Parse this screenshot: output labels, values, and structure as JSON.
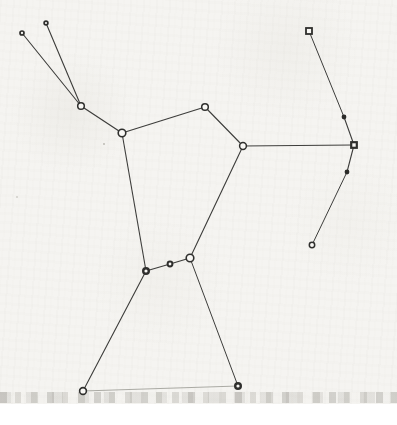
{
  "page": {
    "kind": "scanned constellation line figure",
    "paper_color": "#f5f4f1",
    "page_white": "#ffffff",
    "paper_height_px": 404
  },
  "diagram": {
    "type": "node-link-constellation",
    "colors": {
      "line": "#3d3d3b",
      "faint_line": "#a2a29b",
      "star_stroke": "#2f2f2d",
      "star_open_fill": "#f9f8f5",
      "star_dark_fill": "#2b2b29"
    },
    "stars": [
      {
        "id": "club-tip-left",
        "x": 22,
        "y": 33,
        "shape": "circle",
        "r": 2.0,
        "sw": 1.7,
        "fill": "open"
      },
      {
        "id": "club-tip-right",
        "x": 46,
        "y": 23,
        "shape": "circle",
        "r": 1.9,
        "sw": 1.7,
        "fill": "open"
      },
      {
        "id": "club-elbow",
        "x": 81,
        "y": 106,
        "shape": "circle",
        "r": 3.3,
        "sw": 1.5,
        "fill": "open"
      },
      {
        "id": "left-shoulder",
        "x": 122,
        "y": 133,
        "shape": "circle",
        "r": 3.8,
        "sw": 1.6,
        "fill": "open"
      },
      {
        "id": "head",
        "x": 205,
        "y": 107,
        "shape": "circle",
        "r": 3.3,
        "sw": 1.5,
        "fill": "open"
      },
      {
        "id": "right-shoulder",
        "x": 243,
        "y": 146,
        "shape": "circle",
        "r": 3.4,
        "sw": 1.5,
        "fill": "open"
      },
      {
        "id": "bow-top",
        "x": 309,
        "y": 31,
        "shape": "square",
        "r": 3.0,
        "sw": 1.8,
        "fill": "open"
      },
      {
        "id": "bow-upper",
        "x": 344,
        "y": 117,
        "shape": "circle",
        "r": 2.4,
        "sw": 0,
        "fill": "dark"
      },
      {
        "id": "bow-middle",
        "x": 354,
        "y": 145,
        "shape": "square",
        "r": 2.8,
        "sw": 2.2,
        "fill": "open"
      },
      {
        "id": "bow-lower",
        "x": 347,
        "y": 172,
        "shape": "circle",
        "r": 2.4,
        "sw": 0,
        "fill": "dark"
      },
      {
        "id": "bow-bottom",
        "x": 312,
        "y": 245,
        "shape": "circle",
        "r": 2.7,
        "sw": 1.5,
        "fill": "open"
      },
      {
        "id": "belt-left",
        "x": 146,
        "y": 271,
        "shape": "circle",
        "r": 2.8,
        "sw": 2.4,
        "fill": "open"
      },
      {
        "id": "belt-center",
        "x": 170,
        "y": 264,
        "shape": "circle",
        "r": 2.4,
        "sw": 2.0,
        "fill": "open"
      },
      {
        "id": "belt-right",
        "x": 190,
        "y": 258,
        "shape": "circle",
        "r": 3.8,
        "sw": 1.6,
        "fill": "open"
      },
      {
        "id": "left-foot",
        "x": 83,
        "y": 391,
        "shape": "circle",
        "r": 3.4,
        "sw": 1.6,
        "fill": "open"
      },
      {
        "id": "right-foot",
        "x": 238,
        "y": 386,
        "shape": "circle",
        "r": 2.8,
        "sw": 2.4,
        "fill": "open"
      }
    ],
    "edges": [
      {
        "a": "club-tip-left",
        "b": "club-elbow",
        "w": 1.1,
        "style": "normal"
      },
      {
        "a": "club-tip-right",
        "b": "club-elbow",
        "w": 1.1,
        "style": "normal"
      },
      {
        "a": "club-elbow",
        "b": "left-shoulder",
        "w": 1.2,
        "style": "normal"
      },
      {
        "a": "left-shoulder",
        "b": "head",
        "w": 1.1,
        "style": "normal"
      },
      {
        "a": "head",
        "b": "right-shoulder",
        "w": 1.1,
        "style": "normal"
      },
      {
        "a": "left-shoulder",
        "b": "belt-left",
        "w": 1.1,
        "style": "normal"
      },
      {
        "a": "right-shoulder",
        "b": "belt-right",
        "w": 1.1,
        "style": "normal"
      },
      {
        "a": "right-shoulder",
        "b": "bow-middle",
        "w": 1.0,
        "style": "normal"
      },
      {
        "a": "bow-top",
        "b": "bow-upper",
        "w": 1.0,
        "style": "normal"
      },
      {
        "a": "bow-upper",
        "b": "bow-middle",
        "w": 1.1,
        "style": "normal"
      },
      {
        "a": "bow-middle",
        "b": "bow-lower",
        "w": 1.1,
        "style": "normal"
      },
      {
        "a": "bow-lower",
        "b": "bow-bottom",
        "w": 1.0,
        "style": "normal"
      },
      {
        "a": "belt-left",
        "b": "belt-center",
        "w": 1.1,
        "style": "normal"
      },
      {
        "a": "belt-center",
        "b": "belt-right",
        "w": 1.1,
        "style": "normal"
      },
      {
        "a": "belt-left",
        "b": "left-foot",
        "w": 1.1,
        "style": "normal"
      },
      {
        "a": "belt-right",
        "b": "right-foot",
        "w": 1.0,
        "style": "normal"
      },
      {
        "a": "left-foot",
        "b": "right-foot",
        "w": 0.9,
        "style": "faint"
      }
    ],
    "specks": [
      {
        "x": 104,
        "y": 144,
        "r": 0.9
      },
      {
        "x": 17,
        "y": 197,
        "r": 0.8
      }
    ]
  }
}
